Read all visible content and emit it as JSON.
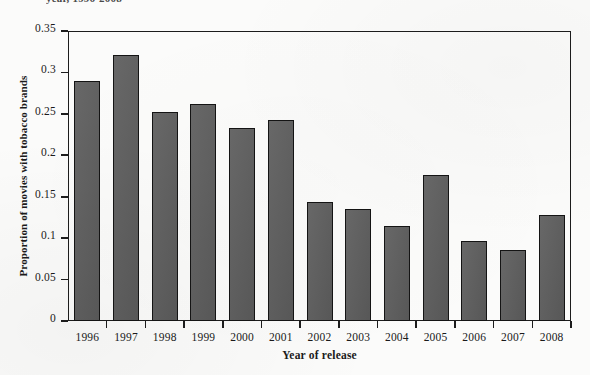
{
  "caption_sliver": "year, 1996-2008",
  "chart_data": {
    "type": "bar",
    "title": "",
    "xlabel": "Year of release",
    "ylabel": "Proportion of movies with tobacco brands",
    "categories": [
      "1996",
      "1997",
      "1998",
      "1999",
      "2000",
      "2001",
      "2002",
      "2003",
      "2004",
      "2005",
      "2006",
      "2007",
      "2008"
    ],
    "values": [
      0.29,
      0.321,
      0.252,
      0.262,
      0.233,
      0.243,
      0.144,
      0.135,
      0.115,
      0.176,
      0.097,
      0.086,
      0.128
    ],
    "ylim": [
      0,
      0.35
    ],
    "yticks": [
      0,
      0.05,
      0.1,
      0.15,
      0.2,
      0.25,
      0.3,
      0.35
    ],
    "ytick_labels": [
      "0",
      "0.05",
      "0.1",
      "0.15",
      "0.2",
      "0.25",
      "0.3",
      "0.35"
    ],
    "grid": false,
    "legend": null,
    "bar_color": "#5c5c5c",
    "bar_edge_color": "#141414",
    "axis_color": "#1c1c1c"
  }
}
